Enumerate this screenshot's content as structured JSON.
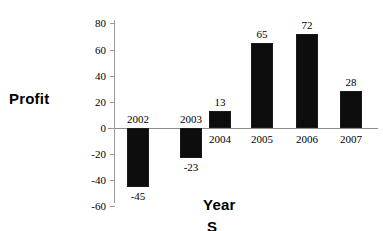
{
  "chart_data": {
    "type": "bar",
    "title": "",
    "xlabel": "Year",
    "ylabel": "Profit",
    "categories": [
      "2002",
      "2003",
      "2004",
      "2005",
      "2006",
      "2007"
    ],
    "values": [
      -45,
      -23,
      13,
      65,
      72,
      28
    ],
    "value_labels": [
      "-45",
      "-23",
      "13",
      "65",
      "72",
      "28"
    ],
    "ylim": [
      -60,
      80
    ],
    "yticks": [
      80,
      60,
      40,
      20,
      0,
      -20,
      -40,
      -60
    ],
    "ytick_labels": [
      "80",
      "60",
      "40",
      "20",
      "0",
      "-20",
      "-40",
      "-60"
    ],
    "grid": false,
    "legend": false,
    "series": [
      {
        "name": "Profit",
        "values": [
          -45,
          -23,
          13,
          65,
          72,
          28
        ],
        "color": "#0d0d0d"
      }
    ],
    "bar_color": "#0d0d0d",
    "axis_color": "#8c8c8c"
  },
  "axis_titles": {
    "y": "Profit",
    "x": "Year",
    "x_clipped_fragment": "S"
  }
}
